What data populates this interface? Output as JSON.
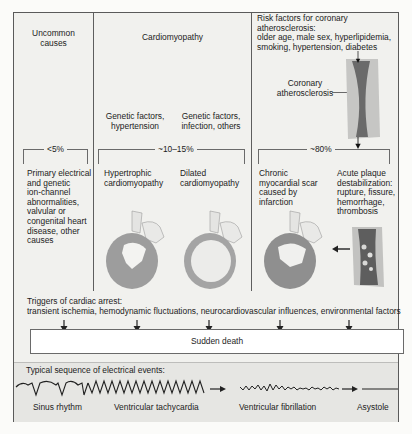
{
  "columns": {
    "uncommon": {
      "title": "Uncommon causes",
      "title_lines": [
        "Uncommon",
        "causes"
      ],
      "percent": "<5%",
      "description_lines": [
        "Primary electrical",
        "and genetic",
        "ion-channel",
        "abnormalities,",
        "valvular or",
        "congenital heart",
        "disease, other",
        "causes"
      ]
    },
    "cardiomyopathy": {
      "title": "Cardiomyopathy",
      "percent": "~10–15%",
      "factors": [
        {
          "lines": [
            "Genetic factors,",
            "hypertension"
          ]
        },
        {
          "lines": [
            "Genetic factors,",
            "infection, others"
          ]
        }
      ],
      "types": [
        {
          "lines": [
            "Hypertrophic",
            "cardiomyopathy"
          ]
        },
        {
          "lines": [
            "Dilated",
            "cardiomyopathy"
          ]
        }
      ]
    },
    "coronary": {
      "risk_factors_lines": [
        "Risk factors for coronary atherosclerosis:",
        "older age, male sex, hyperlipidemia,",
        "smoking, hypertension, diabetes"
      ],
      "vessel_label_lines": [
        "Coronary",
        "atherosclerosis"
      ],
      "percent": "~80%",
      "outcomes": [
        {
          "lines": [
            "Chronic",
            "myocardial scar",
            "caused by",
            "infarction"
          ]
        },
        {
          "lines": [
            "Acute plaque",
            "destabilization:",
            "rupture, fissure,",
            "hemorrhage,",
            "thrombosis"
          ]
        }
      ]
    }
  },
  "triggers": {
    "title": "Triggers of cardiac arrest:",
    "list": "transient ischemia, hemodynamic fluctuations, neurocardiovascular influences, environmental factors"
  },
  "outcome": {
    "label": "Sudden death"
  },
  "electrical_events": {
    "title": "Typical sequence of electrical events:",
    "stages": [
      "Sinus rhythm",
      "Ventricular tachycardia",
      "Ventricular fibrillation",
      "Asystole"
    ]
  },
  "colors": {
    "frame_border": "#5a5a5a",
    "panel_bg": "#f1f1ee",
    "events_bg": "#e6e6e3",
    "heart_gray": "#9b9b9b",
    "vessel_dark": "#5f5f5f"
  }
}
